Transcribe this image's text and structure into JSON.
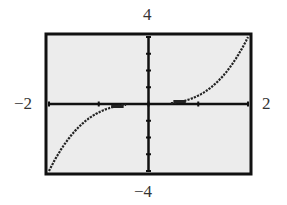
{
  "chart_data": {
    "type": "line",
    "title": "",
    "function": "y = 0.5 x^3",
    "xlabel": "",
    "ylabel": "",
    "xlim": [
      -2,
      2
    ],
    "ylim": [
      -4,
      4
    ],
    "xscale": 1,
    "yscale": 1,
    "grid": false,
    "window_labels": {
      "xmin": "−2",
      "xmax": "2",
      "ymin": "−4",
      "ymax": "4"
    },
    "series": [
      {
        "name": "curve",
        "style": "dotted",
        "x": [
          -2,
          -1.75,
          -1.5,
          -1.25,
          -1,
          -0.75,
          -0.5,
          0.5,
          0.75,
          1,
          1.25,
          1.5,
          1.75,
          2
        ],
        "values": [
          -4,
          -2.68,
          -1.69,
          -0.98,
          -0.5,
          -0.21,
          -0.06,
          0.06,
          0.21,
          0.5,
          0.98,
          1.69,
          2.68,
          4
        ]
      }
    ]
  },
  "colors": {
    "frame": "#111111",
    "background": "#ececec",
    "curve": "#222222",
    "axes": "#111111"
  }
}
